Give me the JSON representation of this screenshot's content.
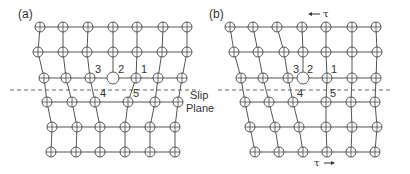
{
  "panels": [
    {
      "id": "a",
      "label": "(a)",
      "label_pos": [
        18,
        18
      ],
      "rows": [
        {
          "y": 27,
          "x": [
            40,
            63,
            88,
            113,
            137,
            163,
            187
          ]
        },
        {
          "y": 52,
          "x": [
            38,
            63,
            87,
            113,
            137,
            162,
            187
          ]
        },
        {
          "y": 78,
          "x": [
            44,
            66,
            90,
            113,
            136,
            158,
            182
          ]
        },
        {
          "y": 102,
          "x": [
            47,
            72,
            95,
            128,
            155,
            178
          ]
        },
        {
          "y": 127,
          "x": [
            52,
            77,
            100,
            125,
            150,
            175
          ]
        },
        {
          "y": 152,
          "x": [
            51,
            76,
            100,
            125,
            150,
            175
          ]
        }
      ],
      "columns_upper": [
        [
          0,
          0,
          0
        ],
        [
          1,
          1,
          1
        ],
        [
          2,
          2,
          2
        ],
        [
          3,
          3,
          3
        ],
        [
          4,
          4,
          4
        ],
        [
          5,
          5,
          5
        ],
        [
          6,
          6,
          6
        ]
      ],
      "columns_lower": [
        [
          0,
          0,
          0
        ],
        [
          1,
          1,
          1
        ],
        [
          2,
          2,
          2
        ],
        [
          3,
          3,
          3
        ],
        [
          4,
          4,
          4
        ],
        [
          5,
          5,
          5
        ]
      ],
      "cross_links": [
        [
          0,
          0
        ],
        [
          1,
          1
        ],
        [
          2,
          2
        ],
        [
          4,
          3
        ],
        [
          5,
          4
        ],
        [
          6,
          5
        ]
      ],
      "big_atom": [
        2,
        3
      ],
      "numbers": [
        {
          "text": "3",
          "x": 95,
          "y": 73
        },
        {
          "text": "2",
          "x": 118,
          "y": 73
        },
        {
          "text": "1",
          "x": 141,
          "y": 73
        },
        {
          "text": "4",
          "x": 100,
          "y": 97
        },
        {
          "text": "5",
          "x": 133,
          "y": 97
        }
      ],
      "slip_plane": {
        "x1": 10,
        "x2": 200,
        "y": 90
      },
      "slip_label": [
        "Slip",
        "Plane"
      ],
      "slip_label_pos": [
        190,
        99
      ],
      "tau_top": null,
      "tau_bottom": null
    },
    {
      "id": "b",
      "label": "(b)",
      "label_pos": [
        209,
        18
      ],
      "rows": [
        {
          "y": 27,
          "x": [
            230,
            253,
            277,
            302,
            326,
            352,
            376
          ]
        },
        {
          "y": 52,
          "x": [
            234,
            258,
            284,
            303,
            326,
            352,
            377
          ]
        },
        {
          "y": 78,
          "x": [
            241,
            263,
            288,
            303,
            327,
            352,
            376
          ]
        },
        {
          "y": 102,
          "x": [
            245,
            269,
            293,
            326,
            351,
            375
          ]
        },
        {
          "y": 127,
          "x": [
            250,
            275,
            299,
            326,
            352,
            377
          ]
        },
        {
          "y": 152,
          "x": [
            255,
            279,
            303,
            327,
            351,
            375
          ]
        }
      ],
      "columns_upper": [
        [
          0,
          0,
          0
        ],
        [
          1,
          1,
          1
        ],
        [
          2,
          2,
          2
        ],
        [
          3,
          3,
          3
        ],
        [
          4,
          4,
          4
        ],
        [
          5,
          5,
          5
        ],
        [
          6,
          6,
          6
        ]
      ],
      "columns_lower": [
        [
          0,
          0,
          0
        ],
        [
          1,
          1,
          1
        ],
        [
          2,
          2,
          2
        ],
        [
          3,
          3,
          3
        ],
        [
          4,
          4,
          4
        ],
        [
          5,
          5,
          5
        ]
      ],
      "cross_links": [
        [
          0,
          0
        ],
        [
          1,
          1
        ],
        [
          2,
          2
        ],
        [
          4,
          3
        ],
        [
          5,
          4
        ],
        [
          6,
          5
        ]
      ],
      "big_atom": [
        2,
        3
      ],
      "numbers": [
        {
          "text": "3",
          "x": 293,
          "y": 73
        },
        {
          "text": "2",
          "x": 307,
          "y": 73
        },
        {
          "text": "1",
          "x": 331,
          "y": 73
        },
        {
          "text": "4",
          "x": 297,
          "y": 97
        },
        {
          "text": "5",
          "x": 330,
          "y": 97
        }
      ],
      "slip_plane": {
        "x1": 218,
        "x2": 392,
        "y": 90
      },
      "slip_label": null,
      "tau_top": {
        "text": "τ",
        "direction": "left",
        "x": 322,
        "y": 17
      },
      "tau_bottom": {
        "text": "τ",
        "direction": "right",
        "x": 322,
        "y": 166
      }
    }
  ]
}
